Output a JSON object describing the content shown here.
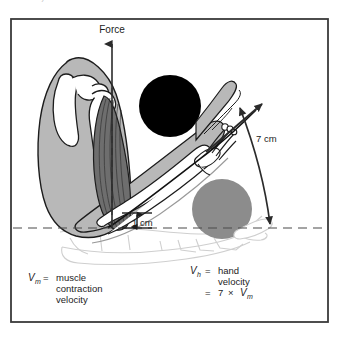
{
  "figure": {
    "top_text_fragment": "the hand).",
    "frame": {
      "border_color": "#3a3a3a"
    },
    "labels": {
      "force": "Force",
      "distance_long": "7 cm",
      "distance_short_value": "1",
      "distance_short_unit": "cm"
    },
    "caption_left": {
      "symbol": "V",
      "subscript": "m",
      "equals": "=",
      "lines": [
        "muscle",
        "contraction",
        "velocity"
      ]
    },
    "caption_right": {
      "symbol": "V",
      "subscript": "h",
      "equals": "=",
      "lines": [
        "hand",
        "velocity"
      ],
      "relation_equals": "=",
      "relation_factor": "7",
      "relation_times": "×",
      "relation_symbol": "V",
      "relation_subscript": "m"
    },
    "colors": {
      "ball_raised": "#000000",
      "ball_lowered": "#8c8c8c",
      "limb_fill": "#b8b8b8",
      "muscle_fill": "#6e6e6e",
      "bone_fill": "#ffffff",
      "ghost_stroke": "#c9c9c9",
      "arrow_stroke": "#2b2b2b",
      "dashed_axis": "#4a4a4a"
    }
  }
}
